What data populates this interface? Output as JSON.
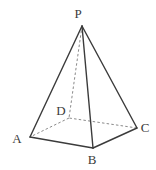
{
  "figure": {
    "kind": "geometry-diagram",
    "shape_name": "square-pyramid",
    "background_color": "#ffffff",
    "stroke_color": "#3b3b3b",
    "hidden_stroke_color": "#8a8a8a",
    "label_color": "#3b3b3b",
    "canvas": {
      "width": 156,
      "height": 170
    },
    "vertices": [
      {
        "id": "P",
        "label": "P",
        "x": 82,
        "y": 26,
        "label_x": 78,
        "label_y": 18,
        "role": "apex",
        "hidden": false
      },
      {
        "id": "A",
        "label": "A",
        "x": 30,
        "y": 137,
        "label_x": 17,
        "label_y": 143,
        "role": "base-front-left",
        "hidden": false
      },
      {
        "id": "B",
        "label": "B",
        "x": 93,
        "y": 148,
        "label_x": 88,
        "label_y": 164,
        "role": "base-front-right",
        "hidden": false
      },
      {
        "id": "C",
        "label": "C",
        "x": 137,
        "y": 128,
        "label_x": 141,
        "label_y": 132,
        "role": "base-back-right",
        "hidden": false
      },
      {
        "id": "D",
        "label": "D",
        "x": 69,
        "y": 118,
        "label_x": 57,
        "label_y": 115,
        "role": "base-back-left",
        "hidden": true
      }
    ],
    "edges": [
      {
        "id": "PA",
        "from": "P",
        "to": "A",
        "style": "solid"
      },
      {
        "id": "PB",
        "from": "P",
        "to": "B",
        "style": "solid"
      },
      {
        "id": "PC",
        "from": "P",
        "to": "C",
        "style": "solid"
      },
      {
        "id": "PD",
        "from": "P",
        "to": "D",
        "style": "dashed"
      },
      {
        "id": "AB",
        "from": "A",
        "to": "B",
        "style": "solid"
      },
      {
        "id": "BC",
        "from": "B",
        "to": "C",
        "style": "solid"
      },
      {
        "id": "CD",
        "from": "C",
        "to": "D",
        "style": "dashed"
      },
      {
        "id": "DA",
        "from": "D",
        "to": "A",
        "style": "dashed"
      }
    ]
  }
}
